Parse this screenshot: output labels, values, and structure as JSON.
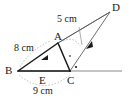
{
  "figure": {
    "type": "geometry-diagram",
    "stroke_color": "#1a1a1a",
    "guide_color": "#9a9a9a",
    "background": "#ffffff"
  },
  "vertices": {
    "A": {
      "label": "A",
      "x": 58,
      "y": 43
    },
    "B": {
      "label": "B",
      "x": 18,
      "y": 71
    },
    "C": {
      "label": "C",
      "x": 70,
      "y": 71
    },
    "D": {
      "label": "D",
      "x": 110,
      "y": 11
    },
    "E": {
      "label": "E",
      "x": 43,
      "y": 71
    }
  },
  "labels": {
    "A": "A",
    "B": "B",
    "C": "C",
    "D": "D",
    "E": "E"
  },
  "measurements": {
    "ba": "8 cm",
    "bc": "9 cm",
    "ad": "5 cm"
  },
  "markers": {
    "right_angle_at_c": "·",
    "angle_tick_at_a": "·"
  }
}
